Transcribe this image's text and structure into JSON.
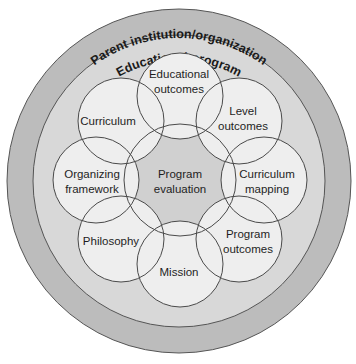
{
  "diagram": {
    "outer_ring": {
      "label": "Parent institution/organization",
      "fill": "#bcbcbc"
    },
    "middle_ring": {
      "label": "Educational program",
      "fill": "#d8d8d8"
    },
    "center_node": {
      "line1": "Program",
      "line2": "evaluation",
      "fill": "#d0d0d0"
    },
    "node_fill": "#eeeeee",
    "stroke": "#4a4a4a",
    "nodes": [
      {
        "line1": "Educational",
        "line2": "outcomes"
      },
      {
        "line1": "Level",
        "line2": "outcomes"
      },
      {
        "line1": "Curriculum",
        "line2": "mapping"
      },
      {
        "line1": "Program",
        "line2": "outcomes"
      },
      {
        "line1": "Mission",
        "line2": ""
      },
      {
        "line1": "Philosophy",
        "line2": ""
      },
      {
        "line1": "Organizing",
        "line2": "framework"
      },
      {
        "line1": "Curriculum",
        "line2": ""
      }
    ]
  }
}
